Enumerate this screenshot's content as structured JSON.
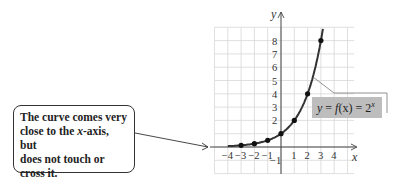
{
  "callout": {
    "lines": [
      "The curve comes very",
      "close to the ",
      "x",
      "-axis, but",
      "does not touch or",
      "cross it."
    ]
  },
  "chart_data": {
    "type": "line",
    "title": "",
    "function_label": "y = f(x) = 2^x",
    "xlabel": "x",
    "ylabel": "y",
    "x_ticks": [
      -4,
      -3,
      -2,
      -1,
      1,
      2,
      3,
      4
    ],
    "y_ticks": [
      -1,
      2,
      3,
      4,
      5,
      6,
      7,
      8
    ],
    "xlim": [
      -5,
      5
    ],
    "ylim": [
      -2,
      9
    ],
    "grid": true,
    "points": [
      {
        "x": -3,
        "y": 0.125
      },
      {
        "x": -2,
        "y": 0.25
      },
      {
        "x": -1,
        "y": 0.5
      },
      {
        "x": 0,
        "y": 1
      },
      {
        "x": 1,
        "y": 2
      },
      {
        "x": 2,
        "y": 4
      },
      {
        "x": 3,
        "y": 8
      }
    ],
    "annotation": "The curve comes very close to the x-axis, but does not touch or cross it."
  },
  "labels": {
    "x_axis": "x",
    "y_axis": "y",
    "eq_y": "y",
    "eq_mid": " = ",
    "eq_f": "f",
    "eq_fx": "(x)",
    "eq_eq2": " = 2",
    "eq_exp": "x"
  }
}
